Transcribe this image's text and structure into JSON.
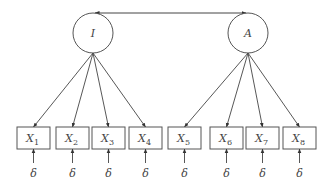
{
  "diagram": {
    "type": "structural-equation-model",
    "colors": {
      "stroke": "#555555",
      "text": "#444444",
      "background": "#ffffff"
    },
    "latent_factors": [
      {
        "id": "I",
        "label": "I",
        "cx": 93,
        "cy": 33,
        "r": 20
      },
      {
        "id": "A",
        "label": "A",
        "cx": 248,
        "cy": 33,
        "r": 20
      }
    ],
    "covariance": {
      "from": "I",
      "to": "A",
      "style": "double-headed-arrow"
    },
    "indicators": [
      {
        "id": "X1",
        "label": "X",
        "sub": "1",
        "factor": "I",
        "x": 17,
        "w": 33
      },
      {
        "id": "X2",
        "label": "X",
        "sub": "2",
        "factor": "I",
        "x": 56,
        "w": 33
      },
      {
        "id": "X3",
        "label": "X",
        "sub": "3",
        "factor": "I",
        "x": 92,
        "w": 33
      },
      {
        "id": "X4",
        "label": "X",
        "sub": "4",
        "factor": "I",
        "x": 129,
        "w": 33
      },
      {
        "id": "X5",
        "label": "X",
        "sub": "5",
        "factor": "A",
        "x": 168,
        "w": 33
      },
      {
        "id": "X6",
        "label": "X",
        "sub": "6",
        "factor": "A",
        "x": 210,
        "w": 33
      },
      {
        "id": "X7",
        "label": "X",
        "sub": "7",
        "factor": "A",
        "x": 246,
        "w": 33
      },
      {
        "id": "X8",
        "label": "X",
        "sub": "8",
        "factor": "A",
        "x": 283,
        "w": 33
      }
    ],
    "error_label": "δ",
    "box_top": 127,
    "box_height": 22
  }
}
